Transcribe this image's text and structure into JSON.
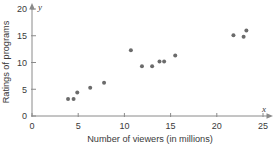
{
  "chart_data": {
    "type": "scatter",
    "title": "",
    "xlabel": "Number of viewers (in millions)",
    "ylabel": "Ratings of programs",
    "xlim": [
      0,
      25
    ],
    "ylim": [
      0,
      20
    ],
    "xticks": [
      0,
      5,
      10,
      15,
      20,
      25
    ],
    "yticks": [
      0,
      5,
      10,
      15,
      20
    ],
    "xtick_labels": [
      "0",
      "5",
      "10",
      "15",
      "20",
      "25"
    ],
    "ytick_labels": [
      "0",
      "5",
      "10",
      "15",
      "20"
    ],
    "grid": false,
    "legend": false,
    "axis_letters": {
      "x": "x",
      "y": "y"
    },
    "point_color": "#6b6b6b",
    "axis_color": "#8a8a8a",
    "text_color": "#3a3a3a",
    "points": [
      {
        "x": 3.9,
        "y": 3.2
      },
      {
        "x": 4.5,
        "y": 3.2
      },
      {
        "x": 4.9,
        "y": 4.4
      },
      {
        "x": 6.3,
        "y": 5.3
      },
      {
        "x": 7.8,
        "y": 6.2
      },
      {
        "x": 10.7,
        "y": 12.3
      },
      {
        "x": 11.9,
        "y": 9.3
      },
      {
        "x": 13.0,
        "y": 9.3
      },
      {
        "x": 13.8,
        "y": 10.2
      },
      {
        "x": 14.3,
        "y": 10.2
      },
      {
        "x": 15.5,
        "y": 11.3
      },
      {
        "x": 21.8,
        "y": 15.1
      },
      {
        "x": 22.9,
        "y": 14.8
      },
      {
        "x": 23.2,
        "y": 16.0
      }
    ]
  }
}
